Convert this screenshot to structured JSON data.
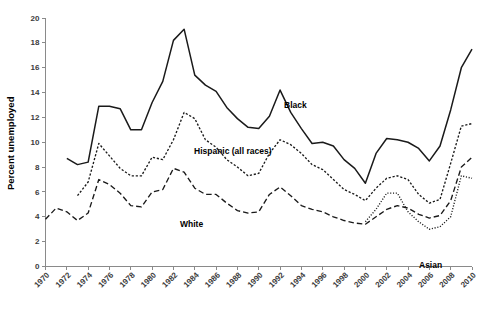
{
  "chart_data": {
    "type": "line",
    "title": "",
    "xlabel": "",
    "ylabel": "Percent unemployed",
    "ylim": [
      0,
      20
    ],
    "xlim": [
      1970,
      2010
    ],
    "grid": false,
    "legend_position": "inline-labels",
    "y_ticks": [
      0,
      2,
      4,
      6,
      8,
      10,
      12,
      14,
      16,
      18,
      20
    ],
    "x_ticks": [
      1970,
      1972,
      1974,
      1976,
      1978,
      1980,
      1982,
      1984,
      1986,
      1988,
      1990,
      1992,
      1994,
      1996,
      1998,
      2000,
      2002,
      2004,
      2006,
      2008,
      2010
    ],
    "series": [
      {
        "name": "Black",
        "label": "Black",
        "style": "solid",
        "color": "#1a1a1a",
        "x": [
          1972,
          1973,
          1974,
          1975,
          1976,
          1977,
          1978,
          1979,
          1980,
          1981,
          1982,
          1983,
          1984,
          1985,
          1986,
          1987,
          1988,
          1989,
          1990,
          1991,
          1992,
          1993,
          1994,
          1995,
          1996,
          1997,
          1998,
          1999,
          2000,
          2001,
          2002,
          2003,
          2004,
          2005,
          2006,
          2007,
          2008,
          2009,
          2010
        ],
        "values": [
          8.7,
          8.2,
          8.4,
          12.9,
          12.9,
          12.7,
          11.0,
          11.0,
          13.2,
          14.9,
          18.2,
          19.1,
          15.4,
          14.6,
          14.1,
          12.8,
          11.9,
          11.2,
          11.1,
          12.1,
          14.2,
          12.4,
          11.1,
          9.9,
          10.0,
          9.7,
          8.6,
          7.9,
          6.7,
          9.1,
          10.3,
          10.2,
          10.0,
          9.5,
          8.5,
          9.7,
          12.6,
          16.0,
          17.5
        ]
      },
      {
        "name": "Hispanic (all races)",
        "label": "Hispanic (all races)",
        "style": "dashed-short",
        "color": "#1a1a1a",
        "x": [
          1973,
          1974,
          1975,
          1976,
          1977,
          1978,
          1979,
          1980,
          1981,
          1982,
          1983,
          1984,
          1985,
          1986,
          1987,
          1988,
          1989,
          1990,
          1991,
          1992,
          1993,
          1994,
          1995,
          1996,
          1997,
          1998,
          1999,
          2000,
          2001,
          2002,
          2003,
          2004,
          2005,
          2006,
          2007,
          2008,
          2009,
          2010
        ],
        "values": [
          5.7,
          6.8,
          9.9,
          8.9,
          7.9,
          7.3,
          7.3,
          8.8,
          8.6,
          10.2,
          12.4,
          11.9,
          10.2,
          9.6,
          8.6,
          8.0,
          7.3,
          7.5,
          9.1,
          10.2,
          9.8,
          9.1,
          8.2,
          7.8,
          7.0,
          6.2,
          5.8,
          5.3,
          6.3,
          7.1,
          7.3,
          7.0,
          5.8,
          5.1,
          5.4,
          8.3,
          11.3,
          11.5
        ]
      },
      {
        "name": "White",
        "label": "White",
        "style": "dashed-long",
        "color": "#1a1a1a",
        "x": [
          1970,
          1971,
          1972,
          1973,
          1974,
          1975,
          1976,
          1977,
          1978,
          1979,
          1980,
          1981,
          1982,
          1983,
          1984,
          1985,
          1986,
          1987,
          1988,
          1989,
          1990,
          1991,
          1992,
          1993,
          1994,
          1995,
          1996,
          1997,
          1998,
          1999,
          2000,
          2001,
          2002,
          2003,
          2004,
          2005,
          2006,
          2007,
          2008,
          2009,
          2010
        ],
        "values": [
          3.8,
          4.7,
          4.4,
          3.7,
          4.3,
          7.0,
          6.6,
          5.9,
          4.9,
          4.8,
          6.0,
          6.2,
          7.9,
          7.6,
          6.3,
          5.8,
          5.8,
          5.1,
          4.5,
          4.3,
          4.4,
          5.8,
          6.4,
          5.7,
          4.9,
          4.6,
          4.4,
          4.0,
          3.7,
          3.5,
          3.4,
          4.0,
          4.6,
          4.9,
          4.7,
          4.2,
          3.9,
          4.1,
          5.3,
          8.0,
          8.8
        ]
      },
      {
        "name": "Asian",
        "label": "Asian",
        "style": "dotted",
        "color": "#1a1a1a",
        "x": [
          2000,
          2001,
          2002,
          2003,
          2004,
          2005,
          2006,
          2007,
          2008,
          2009,
          2010
        ],
        "values": [
          3.6,
          4.6,
          5.9,
          5.9,
          4.4,
          3.6,
          3.0,
          3.2,
          4.0,
          7.3,
          7.1
        ]
      }
    ]
  },
  "axis": {
    "y_title": "Percent unemployed"
  }
}
